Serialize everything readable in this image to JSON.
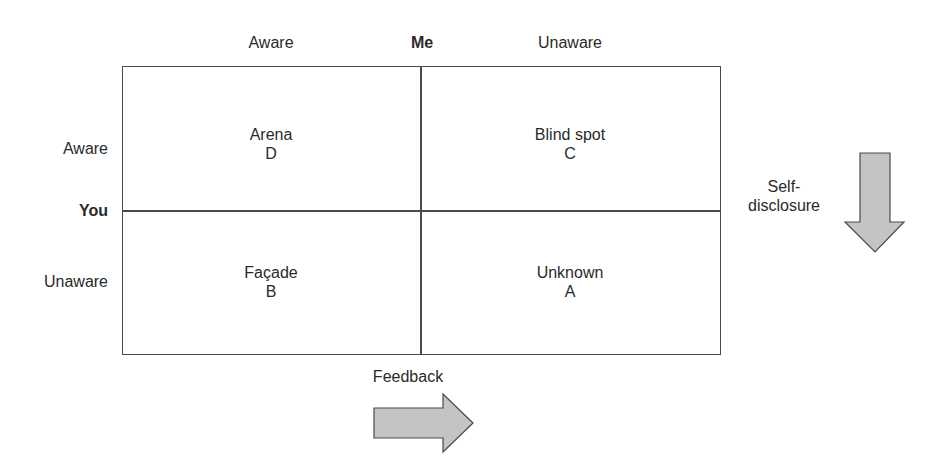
{
  "diagram": {
    "type": "johari-window",
    "top_axis": {
      "title": "Me",
      "left_label": "Aware",
      "right_label": "Unaware"
    },
    "left_axis": {
      "title": "You",
      "top_label": "Aware",
      "bottom_label": "Unaware"
    },
    "quadrants": [
      {
        "position": "top-left",
        "name": "Arena",
        "letter": "D"
      },
      {
        "position": "top-right",
        "name": "Blind spot",
        "letter": "C"
      },
      {
        "position": "bottom-left",
        "name": "Façade",
        "letter": "B"
      },
      {
        "position": "bottom-right",
        "name": "Unknown",
        "letter": "A"
      }
    ],
    "arrows": {
      "down": {
        "label_line1": "Self-",
        "label_line2": "disclosure",
        "direction": "down"
      },
      "right": {
        "label": "Feedback",
        "direction": "right"
      }
    },
    "colors": {
      "line": "#4a4a4a",
      "arrow_fill": "#c4c4c4",
      "arrow_stroke": "#4a4a4a",
      "text": "#2a2a2a"
    }
  }
}
